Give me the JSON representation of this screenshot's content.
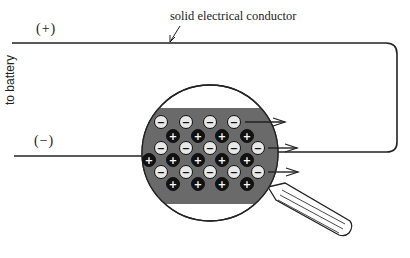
{
  "labels": {
    "conductor": "solid electrical conductor",
    "positive_terminal": "(+)",
    "negative_terminal": "(−)",
    "to_battery": "to battery"
  },
  "particles": {
    "electron_symbol": "−",
    "ion_symbol": "+",
    "electron_color": "#e8e8e8",
    "ion_color": "#111111",
    "conductor_color": "#6a6a6a"
  },
  "rows": [
    {
      "type": "electron",
      "y": 122,
      "x": [
        161,
        186,
        210,
        234
      ]
    },
    {
      "type": "ion",
      "y": 136,
      "x": [
        173,
        198,
        222,
        247
      ]
    },
    {
      "type": "electron",
      "y": 148,
      "x": [
        161,
        186,
        210,
        234,
        258
      ]
    },
    {
      "type": "ion",
      "y": 160,
      "x": [
        149,
        173,
        198,
        222,
        247
      ]
    },
    {
      "type": "electron",
      "y": 172,
      "x": [
        161,
        186,
        210,
        234,
        258
      ]
    },
    {
      "type": "ion",
      "y": 184,
      "x": [
        173,
        198,
        222,
        247
      ]
    }
  ],
  "arrows": [
    {
      "x1": 245,
      "y": 122,
      "x2": 285
    },
    {
      "x1": 268,
      "y": 148,
      "x2": 297
    },
    {
      "x1": 268,
      "y": 172,
      "x2": 298
    }
  ]
}
